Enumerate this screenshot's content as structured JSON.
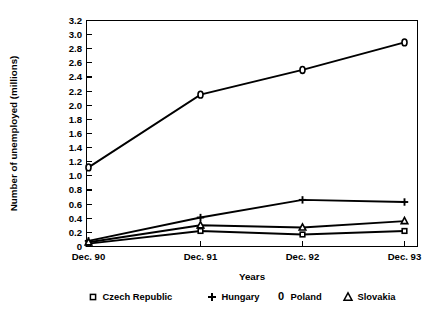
{
  "chart_data": {
    "type": "line",
    "title": "",
    "xlabel": "Years",
    "ylabel": "Number of unemployed (millions)",
    "categories": [
      "Dec. 90",
      "Dec. 91",
      "Dec. 92",
      "Dec. 93"
    ],
    "ylim": [
      0,
      3.2
    ],
    "ytick_labels": [
      "0",
      "0.2",
      "0.4",
      "0.6",
      "0.8",
      "1.0",
      "1.2",
      "1.4",
      "1.6",
      "1.8",
      "2.0",
      "2.2",
      "2.4",
      "2.6",
      "2.8",
      "3.0",
      "3.2"
    ],
    "ytick_values": [
      0,
      0.2,
      0.4,
      0.6,
      0.8,
      1.0,
      1.2,
      1.4,
      1.6,
      1.8,
      2.0,
      2.2,
      2.4,
      2.6,
      2.8,
      3.0,
      3.2
    ],
    "grid": false,
    "legend_position": "bottom",
    "series": [
      {
        "name": "Czech Republic",
        "marker": "square",
        "values": [
          0.04,
          0.22,
          0.17,
          0.22
        ]
      },
      {
        "name": "Hungary",
        "marker": "plus",
        "values": [
          0.08,
          0.41,
          0.66,
          0.63
        ]
      },
      {
        "name": "Poland",
        "marker": "circle",
        "values": [
          1.12,
          2.15,
          2.5,
          2.89
        ]
      },
      {
        "name": "Slovakia",
        "marker": "triangle",
        "values": [
          0.06,
          0.3,
          0.27,
          0.36
        ]
      }
    ]
  },
  "legend": {
    "items": [
      {
        "label": "Czech Republic",
        "glyph": "square-marker-icon"
      },
      {
        "label": "Hungary",
        "glyph": "plus-marker-icon"
      },
      {
        "label": "Poland",
        "glyph": "zero-marker-icon",
        "glyph_text": "0"
      },
      {
        "label": "Slovakia",
        "glyph": "triangle-marker-icon"
      }
    ]
  },
  "colors": {
    "line": "#000000",
    "marker_fill": "#ffffff",
    "background": "#ffffff"
  }
}
